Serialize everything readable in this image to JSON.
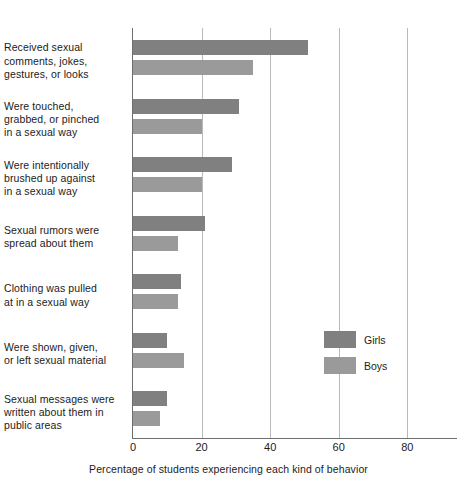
{
  "chart_data": {
    "type": "bar",
    "orientation": "horizontal",
    "title": "",
    "xlabel": "Percentage of students experiencing each kind of behavior",
    "ylabel": "",
    "xlim": [
      0,
      84
    ],
    "xticks": [
      0,
      20,
      40,
      60,
      80
    ],
    "xtick_labels": [
      "0",
      "20",
      "40",
      "60",
      "80"
    ],
    "grid": true,
    "legend_position": "right-inside",
    "categories": [
      "Received sexual comments, jokes, gestures, or looks",
      "Were touched, grabbed, or pinched in a sexual way",
      "Were intentionally brushed up against in a sexual way",
      "Sexual rumors were spread about them",
      "Clothing was pulled at in a sexual way",
      "Were shown, given, or left sexual material",
      "Sexual messages were written about them in public areas"
    ],
    "category_lines": [
      [
        "Received sexual",
        "comments, jokes,",
        "gestures, or looks"
      ],
      [
        "Were touched,",
        "grabbed, or pinched",
        "in a sexual way"
      ],
      [
        "Were intentionally",
        "brushed up against",
        "in a sexual way"
      ],
      [
        "Sexual rumors were",
        "spread about them"
      ],
      [
        "Clothing was pulled",
        "at in a sexual way"
      ],
      [
        "Were shown, given,",
        "or left sexual material"
      ],
      [
        "Sexual messages were",
        "written about them in",
        "public areas"
      ]
    ],
    "series": [
      {
        "name": "Girls",
        "color": "#808080",
        "values": [
          51,
          31,
          29,
          21,
          14,
          10,
          10
        ]
      },
      {
        "name": "Boys",
        "color": "#9a9a9a",
        "values": [
          35,
          20,
          20,
          13,
          13,
          15,
          8
        ]
      }
    ]
  },
  "legend": {
    "items": [
      {
        "label": "Girls",
        "color": "#808080"
      },
      {
        "label": "Boys",
        "color": "#9a9a9a"
      }
    ]
  }
}
